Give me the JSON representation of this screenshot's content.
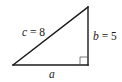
{
  "diagram": {
    "type": "right-triangle",
    "vertices": {
      "left": {
        "x": 13,
        "y": 65
      },
      "bottom_right": {
        "x": 88,
        "y": 65
      },
      "top_right": {
        "x": 88,
        "y": 7
      }
    },
    "right_angle_marker": {
      "x": 80,
      "y": 57,
      "size": 8
    },
    "stroke_color": "#1a1a1a",
    "labels": {
      "hypotenuse": {
        "var": "c",
        "eq": " = ",
        "value": "8"
      },
      "vertical_leg": {
        "var": "b",
        "eq": " = ",
        "value": "5"
      },
      "horizontal_leg": {
        "var": "a"
      }
    }
  }
}
